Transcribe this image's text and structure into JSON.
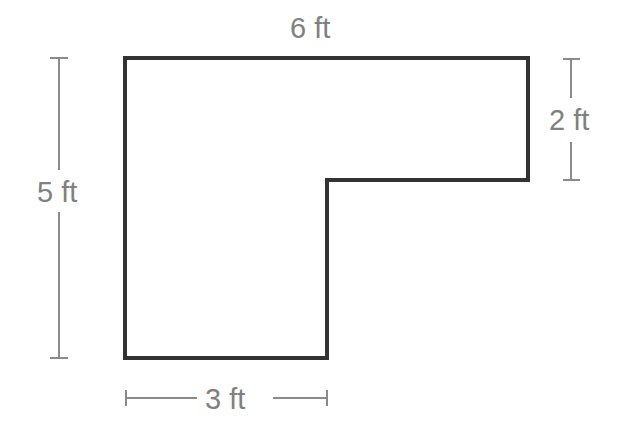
{
  "diagram": {
    "type": "L-shaped figure with dimensions",
    "colors": {
      "shape": "#333333",
      "dimension": "#8a8a8a",
      "background": "#ffffff"
    },
    "shape_points": [
      [
        125,
        58
      ],
      [
        528,
        58
      ],
      [
        528,
        180
      ],
      [
        327,
        180
      ],
      [
        327,
        358
      ],
      [
        125,
        358
      ]
    ],
    "labels": {
      "top": "6 ft",
      "right": "2 ft",
      "left": "5 ft",
      "bottom": "3 ft"
    }
  }
}
